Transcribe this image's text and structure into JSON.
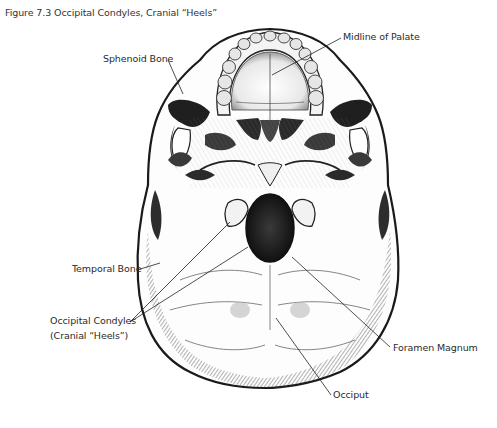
{
  "figure": {
    "title": "Figure 7.3 Occipital Condyles, Cranial “Heels”",
    "labels": {
      "midline_of_palate": "Midline of Palate",
      "sphenoid_bone": "Sphenoid Bone",
      "temporal_bone": "Temporal Bone",
      "occipital_condyles_line1": "Occipital Condyles",
      "occipital_condyles_line2": "(Cranial “Heels”)",
      "foramen_magnum": "Foramen Magnum",
      "occiput": "Occiput"
    },
    "colors": {
      "ink": "#1a1a1a",
      "paper": "#ffffff",
      "shade": "#555555"
    }
  }
}
